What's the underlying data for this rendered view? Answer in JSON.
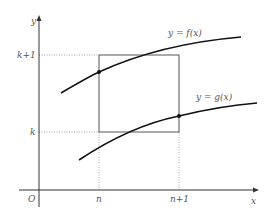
{
  "diagram": {
    "axes": {
      "x_label": "x",
      "y_label": "y",
      "origin_label": "O"
    },
    "ticks": {
      "x": [
        {
          "label": "n"
        },
        {
          "label": "n+1"
        }
      ],
      "y": [
        {
          "label": "k+1"
        },
        {
          "label": "k"
        }
      ]
    },
    "curves": [
      {
        "name": "f",
        "label": "y = f(x)"
      },
      {
        "name": "g",
        "label": "y = g(x)"
      }
    ],
    "colors": {
      "axis": "#333333",
      "curve": "#111111",
      "rect": "#555555",
      "dotted": "#999999",
      "text": "#555555"
    }
  }
}
